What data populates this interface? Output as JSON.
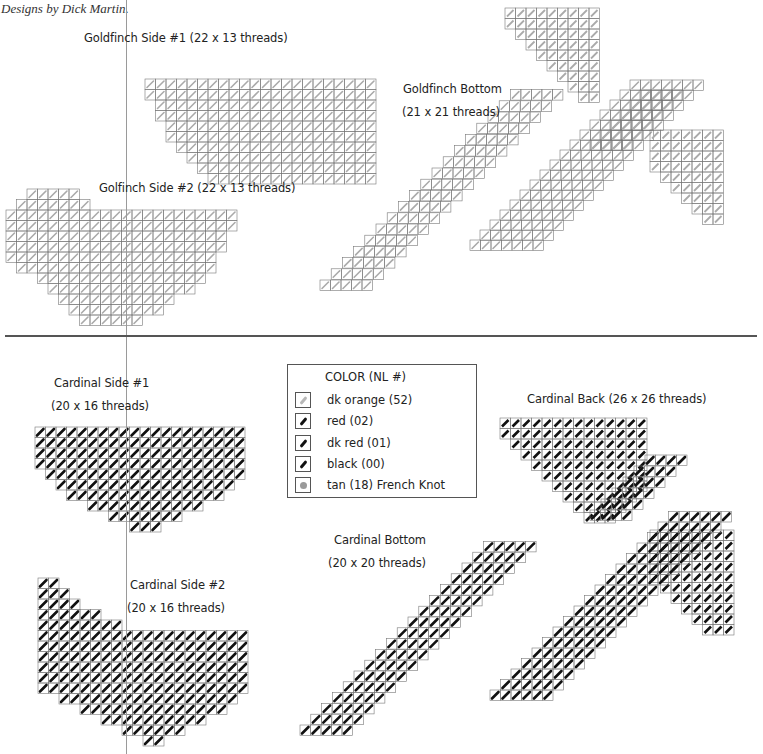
{
  "credit": "Designs by Dick Martin.",
  "goldfinch": {
    "side1": "Goldfinch Side #1 (22 x 13 threads)",
    "side2": "Golfinch Side #2 (22 x 13 threads)",
    "bottom_title": "Goldfinch Bottom",
    "bottom_size": "(21 x 21 threads)"
  },
  "cardinal": {
    "side1_title": "Cardinal Side #1",
    "side1_size": "(20 x 16 threads)",
    "side2_title": "Cardinal Side #2",
    "side2_size": "(20 x 16 threads)",
    "bottom_title": "Cardinal Bottom",
    "bottom_size": "(20 x 20 threads)",
    "back": "Cardinal Back (26 x 26 threads)"
  },
  "legend": {
    "title": "COLOR (NL #)",
    "items": [
      {
        "label": "dk orange (52)",
        "color": "#b0b0b0",
        "type": "stitch"
      },
      {
        "label": "red (02)",
        "color": "#111111",
        "type": "stitch"
      },
      {
        "label": "dk red (01)",
        "color": "#111111",
        "type": "stitch"
      },
      {
        "label": "black (00)",
        "color": "#111111",
        "type": "stitch"
      },
      {
        "label": "tan (18) French Knot",
        "color": "#9a9a9a",
        "type": "knot"
      }
    ]
  },
  "colors": {
    "grid": "#777777",
    "light_stitch": "#aaaaaa",
    "dark_stitch": "#111111",
    "marker": "#999999"
  }
}
